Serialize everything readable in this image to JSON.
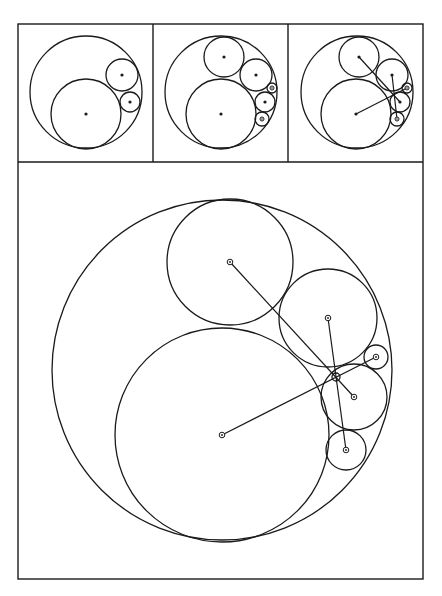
{
  "figure": {
    "stroke_color": "#1a1a1a",
    "background": "#ffffff",
    "frame": {
      "x": 18,
      "y": 24,
      "width": 405,
      "height": 555,
      "divider_y": 162,
      "column_dividers": [
        153,
        288
      ]
    },
    "panels": [
      {
        "id": "step-1",
        "circles": [
          {
            "name": "outer",
            "cx": 86,
            "cy": 92,
            "r": 56,
            "center": "none"
          },
          {
            "name": "large",
            "cx": 86,
            "cy": 114,
            "r": 35,
            "center": "dot"
          },
          {
            "name": "medium",
            "cx": 122,
            "cy": 75,
            "r": 16,
            "center": "dot"
          },
          {
            "name": "small",
            "cx": 130,
            "cy": 102,
            "r": 10,
            "center": "dot"
          }
        ],
        "lines": []
      },
      {
        "id": "step-2",
        "circles": [
          {
            "name": "outer",
            "cx": 221,
            "cy": 92,
            "r": 56,
            "center": "none"
          },
          {
            "name": "top",
            "cx": 224,
            "cy": 57,
            "r": 20,
            "center": "dot"
          },
          {
            "name": "right-upper",
            "cx": 256,
            "cy": 75,
            "r": 16,
            "center": "dot"
          },
          {
            "name": "tiny",
            "cx": 272,
            "cy": 88,
            "r": 5,
            "center": "ring"
          },
          {
            "name": "right-middle",
            "cx": 265,
            "cy": 102,
            "r": 10,
            "center": "dot"
          },
          {
            "name": "right-lower",
            "cx": 262,
            "cy": 119,
            "r": 7,
            "center": "ring"
          },
          {
            "name": "large",
            "cx": 221,
            "cy": 114,
            "r": 35,
            "center": "dot"
          }
        ],
        "lines": []
      },
      {
        "id": "step-3",
        "circles": [
          {
            "name": "outer",
            "cx": 357,
            "cy": 92,
            "r": 56,
            "center": "none"
          },
          {
            "name": "top",
            "cx": 359,
            "cy": 57,
            "r": 20,
            "center": "dot"
          },
          {
            "name": "right-upper",
            "cx": 392,
            "cy": 75,
            "r": 16,
            "center": "dot"
          },
          {
            "name": "tiny",
            "cx": 407,
            "cy": 88,
            "r": 5,
            "center": "ring"
          },
          {
            "name": "right-middle",
            "cx": 400,
            "cy": 102,
            "r": 10,
            "center": "dot"
          },
          {
            "name": "right-lower",
            "cx": 397,
            "cy": 119,
            "r": 7,
            "center": "ring"
          },
          {
            "name": "large",
            "cx": 356,
            "cy": 114,
            "r": 35,
            "center": "dot"
          }
        ],
        "lines": [
          {
            "x1": 359,
            "y1": 57,
            "x2": 400,
            "y2": 102
          },
          {
            "x1": 392,
            "y1": 75,
            "x2": 397,
            "y2": 119
          },
          {
            "x1": 356,
            "y1": 114,
            "x2": 407,
            "y2": 88
          }
        ]
      },
      {
        "id": "enlarged",
        "circles": [
          {
            "name": "outer",
            "cx": 222,
            "cy": 370,
            "r": 170,
            "center": "none"
          },
          {
            "name": "top",
            "cx": 230,
            "cy": 262,
            "r": 63,
            "center": "ring"
          },
          {
            "name": "right-upper",
            "cx": 328,
            "cy": 318,
            "r": 49,
            "center": "ring"
          },
          {
            "name": "tiny",
            "cx": 376,
            "cy": 357,
            "r": 12,
            "center": "ring"
          },
          {
            "name": "right-middle",
            "cx": 354,
            "cy": 397,
            "r": 33,
            "center": "ring"
          },
          {
            "name": "right-lower",
            "cx": 346,
            "cy": 450,
            "r": 20,
            "center": "ring"
          },
          {
            "name": "large",
            "cx": 222,
            "cy": 435,
            "r": 107,
            "center": "ring"
          },
          {
            "name": "junction",
            "cx": 336,
            "cy": 377,
            "r": 4,
            "center": "none"
          }
        ],
        "lines": [
          {
            "x1": 230,
            "y1": 262,
            "x2": 354,
            "y2": 397
          },
          {
            "x1": 328,
            "y1": 318,
            "x2": 346,
            "y2": 450
          },
          {
            "x1": 222,
            "y1": 435,
            "x2": 376,
            "y2": 357
          }
        ]
      }
    ]
  }
}
